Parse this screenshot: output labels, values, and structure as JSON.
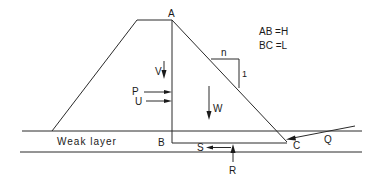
{
  "diagram": {
    "type": "dam-on-weak-layer-force-diagram",
    "legend": {
      "line1": "AB =H",
      "line2": "BC =L"
    },
    "points": {
      "A": "A",
      "B": "B",
      "C": "C"
    },
    "slope": {
      "horizontal": "n",
      "vertical": "1"
    },
    "forces": {
      "V": "V",
      "P": "P",
      "U": "U",
      "W": "W",
      "S": "S",
      "R": "R",
      "Q": "Q"
    },
    "layer_label": "Weak layer",
    "colors": {
      "ink": "#1a1a1a",
      "background": "#ffffff"
    }
  }
}
